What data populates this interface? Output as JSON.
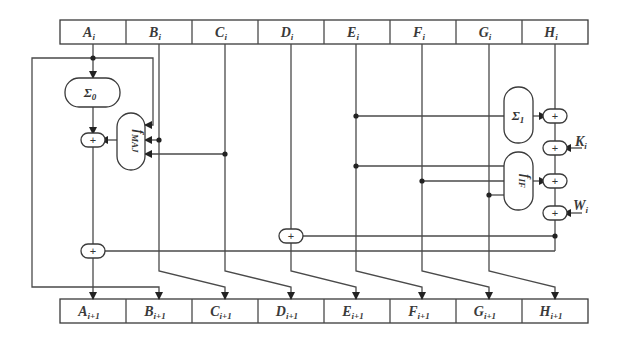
{
  "diagram": {
    "input_registers": [
      {
        "name": "A",
        "sub": "i"
      },
      {
        "name": "B",
        "sub": "i"
      },
      {
        "name": "C",
        "sub": "i"
      },
      {
        "name": "D",
        "sub": "i"
      },
      {
        "name": "E",
        "sub": "i"
      },
      {
        "name": "F",
        "sub": "i"
      },
      {
        "name": "G",
        "sub": "i"
      },
      {
        "name": "H",
        "sub": "i"
      }
    ],
    "output_registers": [
      {
        "name": "A",
        "sub": "i+1"
      },
      {
        "name": "B",
        "sub": "i+1"
      },
      {
        "name": "C",
        "sub": "i+1"
      },
      {
        "name": "D",
        "sub": "i+1"
      },
      {
        "name": "E",
        "sub": "i+1"
      },
      {
        "name": "F",
        "sub": "i+1"
      },
      {
        "name": "G",
        "sub": "i+1"
      },
      {
        "name": "H",
        "sub": "i+1"
      }
    ],
    "functions": {
      "sigma0": {
        "symbol": "Σ",
        "sub": "0"
      },
      "sigma1": {
        "symbol": "Σ",
        "sub": "1"
      },
      "fmaj": {
        "symbol": "f",
        "sub": "MAJ"
      },
      "fif": {
        "symbol": "f",
        "sub": "IF"
      }
    },
    "inputs": {
      "k": {
        "name": "K",
        "sub": "i"
      },
      "w": {
        "name": "W",
        "sub": "i"
      }
    },
    "adder_symbol": "+",
    "colors": {
      "line": "#4a4a4a",
      "box_stroke": "#3a3a3a",
      "background": "#ffffff"
    }
  }
}
